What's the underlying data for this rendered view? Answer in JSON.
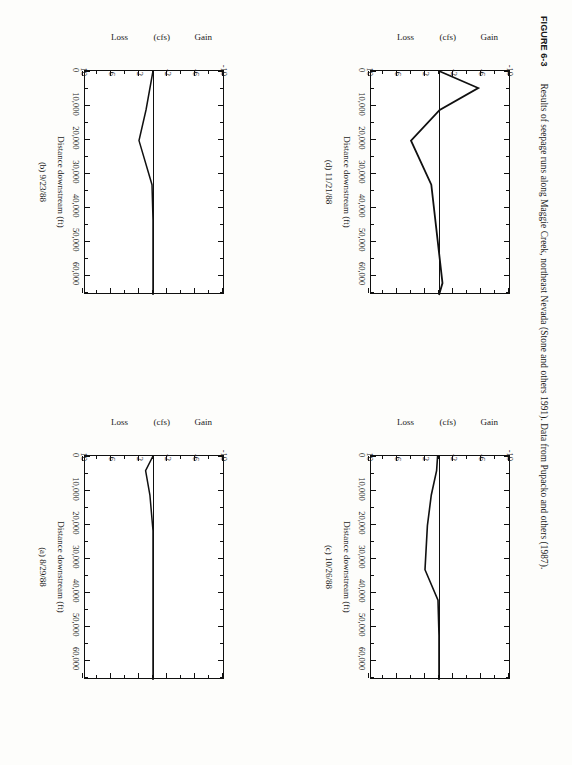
{
  "figure": {
    "number": "FIGURE 6-3",
    "caption": "Results of seepage runs along Maggie Creek, northeast Nevada (Stone and others 1991). Data from Pupacko and others (1987).",
    "page_background": "#fdfdfb",
    "ink_color": "#101010"
  },
  "axis": {
    "xlabel": "Distance downstream (ft)",
    "ylabel_gain": "Gain",
    "ylabel_units": "(cfs)",
    "ylabel_loss": "Loss",
    "xticks": [
      "0",
      "10,000",
      "20,000",
      "30,000",
      "40,000",
      "50,000",
      "60,000"
    ],
    "yticks": [
      "10",
      "6",
      "2",
      "-2",
      "-6",
      "-10"
    ]
  },
  "chart_data": [
    {
      "type": "line",
      "title": "(a) 8/29/88",
      "panel": "a",
      "xlabel": "Distance downstream (ft)",
      "ylabel": "Gain / Loss (cfs)",
      "xlim": [
        0,
        66000
      ],
      "ylim": [
        -10,
        10
      ],
      "xticks": [
        0,
        10000,
        20000,
        30000,
        40000,
        50000,
        60000
      ],
      "yticks": [
        -10,
        -6,
        -2,
        2,
        6,
        10
      ],
      "grid": false,
      "legend": "none",
      "x": [
        0,
        4300,
        11500,
        22000,
        33500,
        44000,
        53000,
        62500,
        66000
      ],
      "values": [
        0,
        -1.05,
        -0.45,
        0,
        0,
        0,
        0,
        0,
        0
      ]
    },
    {
      "type": "line",
      "title": "(b) 9/23/88",
      "panel": "b",
      "xlabel": "Distance downstream (ft)",
      "ylabel": "Gain / Loss (cfs)",
      "xlim": [
        0,
        66000
      ],
      "ylim": [
        -10,
        10
      ],
      "xticks": [
        0,
        10000,
        20000,
        30000,
        40000,
        50000,
        60000
      ],
      "yticks": [
        -10,
        -6,
        -2,
        2,
        6,
        10
      ],
      "grid": false,
      "legend": "none",
      "x": [
        0,
        11500,
        20500,
        33500,
        44000,
        53000,
        62500,
        66000
      ],
      "values": [
        0,
        -1.0,
        -2.0,
        -0.15,
        0,
        0,
        0,
        0
      ]
    },
    {
      "type": "line",
      "title": "(c) 10/26/88",
      "panel": "c",
      "xlabel": "Distance downstream (ft)",
      "ylabel": "Gain / Loss (cfs)",
      "xlim": [
        0,
        66000
      ],
      "ylim": [
        -10,
        10
      ],
      "xticks": [
        0,
        10000,
        20000,
        30000,
        40000,
        50000,
        60000
      ],
      "yticks": [
        -10,
        -6,
        -2,
        2,
        6,
        10
      ],
      "grid": false,
      "legend": "none",
      "x": [
        0,
        4300,
        11500,
        20500,
        33500,
        42500,
        53000,
        62500,
        66000
      ],
      "values": [
        -0.2,
        -0.35,
        -1.1,
        -1.65,
        -2.0,
        -0.15,
        0,
        0,
        0
      ]
    },
    {
      "type": "line",
      "title": "(d) 11/21/88",
      "panel": "d",
      "xlabel": "Distance downstream (ft)",
      "ylabel": "Gain / Loss (cfs)",
      "xlim": [
        0,
        66000
      ],
      "ylim": [
        -10,
        10
      ],
      "xticks": [
        0,
        10000,
        20000,
        30000,
        40000,
        50000,
        60000
      ],
      "yticks": [
        -10,
        -6,
        -2,
        2,
        6,
        10
      ],
      "grid": false,
      "legend": "none",
      "x": [
        0,
        5000,
        11500,
        20500,
        33500,
        62500,
        66000
      ],
      "values": [
        0,
        5.6,
        0.1,
        -4.0,
        -1.1,
        0.5,
        0
      ]
    }
  ]
}
